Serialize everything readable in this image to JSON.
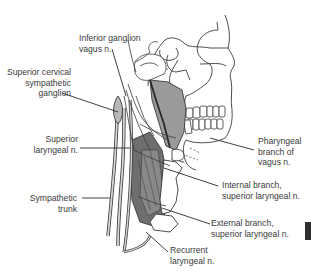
{
  "figure": {
    "colors": {
      "line": "#3a3a3a",
      "muscle_fill": "#9a9a9a",
      "muscle_dark": "#6e6e6e",
      "nerve_fill": "#c8c8c8",
      "background": "#ffffff",
      "tab": "#2e2e2e"
    }
  },
  "labels": {
    "inferior_ganglion": {
      "line1": "Inferior ganglion",
      "line2": "vagus n."
    },
    "superior_cervical": {
      "line1": "Superior cervical",
      "line2": "sympathetic",
      "line3": "ganglion"
    },
    "superior_laryngeal": {
      "line1": "Superior",
      "line2": "laryngeal n."
    },
    "sympathetic_trunk": {
      "line1": "Sympathetic",
      "line2": "trunk"
    },
    "pharyngeal_branch": {
      "line1": "Pharyngeal",
      "line2": "branch of",
      "line3": "vagus n."
    },
    "internal_branch": {
      "line1": "Internal branch,",
      "line2": "superior laryngeal n."
    },
    "external_branch": {
      "line1": "External branch,",
      "line2": "superior laryngeal n."
    },
    "recurrent_laryngeal": {
      "line1": "Recurrent",
      "line2": "laryngeal n."
    }
  }
}
